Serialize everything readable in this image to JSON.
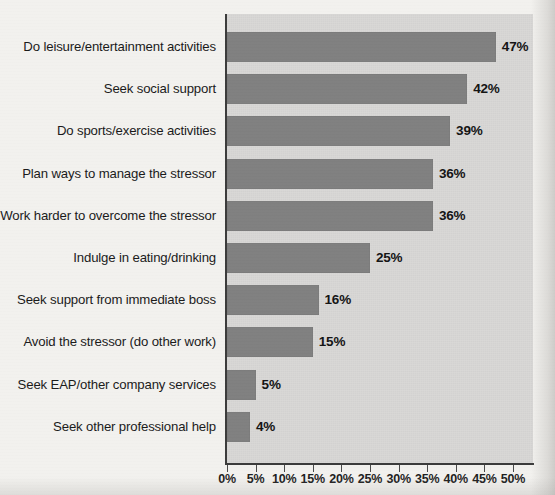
{
  "chart_data": {
    "type": "bar",
    "orientation": "horizontal",
    "title": "",
    "xlabel": "",
    "ylabel": "",
    "xlim": [
      0,
      50
    ],
    "grid": false,
    "legend": null,
    "bar_color": "#808080",
    "plot_background": "#d9d8d6",
    "page_background": "#f2f1ee",
    "xticks": [
      "0%",
      "5%",
      "10%",
      "15%",
      "20%",
      "25%",
      "30%",
      "35%",
      "40%",
      "45%",
      "50%"
    ],
    "xtick_values": [
      0,
      5,
      10,
      15,
      20,
      25,
      30,
      35,
      40,
      45,
      50
    ],
    "categories": [
      "Do leisure/entertainment activities",
      "Seek social support",
      "Do sports/exercise activities",
      "Plan ways to manage the stressor",
      "Work harder to overcome the stressor",
      "Indulge in eating/drinking",
      "Seek support from immediate boss",
      "Avoid the stressor (do other work)",
      "Seek EAP/other company services",
      "Seek other professional help"
    ],
    "values": [
      47,
      42,
      39,
      36,
      36,
      25,
      16,
      15,
      5,
      4
    ],
    "value_labels": [
      "47%",
      "42%",
      "39%",
      "36%",
      "36%",
      "25%",
      "16%",
      "15%",
      "5%",
      "4%"
    ]
  }
}
